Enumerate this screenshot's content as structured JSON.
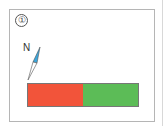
{
  "figure": {
    "label": "①",
    "compass": {
      "pole_label": "N",
      "north_color": "#3aa6dc",
      "south_color": "#ffffff"
    },
    "magnet": {
      "left_color": "#f2543a",
      "right_color": "#5cbc57"
    }
  }
}
